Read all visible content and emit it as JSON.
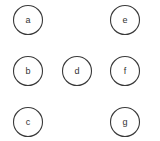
{
  "diagram": {
    "type": "node-graph",
    "edges": [],
    "nodes": [
      {
        "id": "a",
        "label": "a",
        "cx": 28,
        "cy": 20
      },
      {
        "id": "b",
        "label": "b",
        "cx": 28,
        "cy": 71
      },
      {
        "id": "c",
        "label": "c",
        "cx": 28,
        "cy": 122
      },
      {
        "id": "d",
        "label": "d",
        "cx": 77,
        "cy": 71
      },
      {
        "id": "e",
        "label": "e",
        "cx": 125,
        "cy": 20
      },
      {
        "id": "f",
        "label": "f",
        "cx": 125,
        "cy": 71
      },
      {
        "id": "g",
        "label": "g",
        "cx": 125,
        "cy": 122
      }
    ],
    "node_radius": 14.5,
    "colors": {
      "stroke": "#3a3a3a",
      "fill": "#ffffff",
      "text": "#333333",
      "background": "#ffffff"
    }
  }
}
